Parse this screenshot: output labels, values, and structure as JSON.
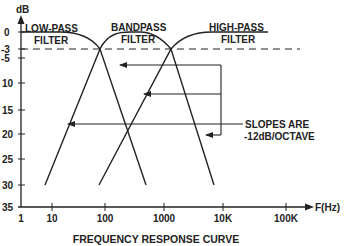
{
  "figure": {
    "caption": "FREQUENCY RESPONSE CURVE",
    "y_axis_label": "dB",
    "x_axis_label": "F(Hz)",
    "y_ticks": [
      "0",
      "-3",
      "-5",
      "10",
      "15",
      "20",
      "25",
      "30",
      "35"
    ],
    "x_ticks": [
      "1",
      "10",
      "100",
      "1000",
      "10K",
      "100K"
    ],
    "curves": {
      "low_pass": {
        "line1": "LOW-PASS",
        "line2": "FILTER"
      },
      "band_pass": {
        "line1": "BANDPASS",
        "line2": "FILTER"
      },
      "high_pass": {
        "line1": "HIGH-PASS",
        "line2": "FILTER"
      }
    },
    "annotation": {
      "line1": "SLOPES ARE",
      "line2": "-12dB/OCTAVE"
    },
    "colors": {
      "ink": "#222222",
      "background": "#ffffff"
    }
  }
}
